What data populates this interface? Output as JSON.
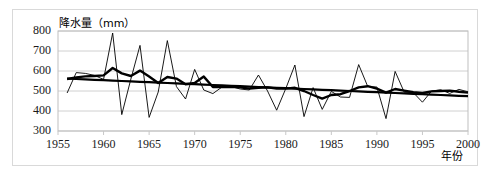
{
  "chart_data": {
    "type": "line",
    "title": "降水量（mm）",
    "xlabel": "年份",
    "ylabel": "",
    "xlim": [
      1955,
      2000
    ],
    "ylim": [
      300,
      800
    ],
    "xticks": [
      "1955",
      "1960",
      "1965",
      "1970",
      "1975",
      "1980",
      "1985",
      "1990",
      "1995",
      "2000"
    ],
    "yticks": [
      "300",
      "400",
      "500",
      "600",
      "700",
      "800"
    ],
    "grid": true,
    "legend": "none",
    "x": [
      1956,
      1957,
      1958,
      1959,
      1960,
      1961,
      1962,
      1963,
      1964,
      1965,
      1966,
      1967,
      1968,
      1969,
      1970,
      1971,
      1972,
      1973,
      1974,
      1975,
      1976,
      1977,
      1978,
      1979,
      1980,
      1981,
      1982,
      1983,
      1984,
      1985,
      1986,
      1987,
      1988,
      1989,
      1990,
      1991,
      1992,
      1993,
      1994,
      1995,
      1996,
      1997,
      1998,
      1999,
      2000
    ],
    "series": [
      {
        "name": "年降水量",
        "style": "thin-line",
        "color": "#000000",
        "values": [
          490,
          592,
          588,
          578,
          558,
          790,
          382,
          560,
          728,
          368,
          495,
          752,
          522,
          460,
          608,
          505,
          487,
          520,
          522,
          510,
          505,
          580,
          500,
          404,
          512,
          630,
          372,
          517,
          408,
          498,
          470,
          468,
          632,
          522,
          520,
          362,
          598,
          494,
          492,
          444,
          500,
          506,
          488,
          508,
          496
        ]
      },
      {
        "name": "滑动平均",
        "style": "thick-line",
        "color": "#000000",
        "values": [
          560,
          568,
          573,
          575,
          578,
          615,
          588,
          575,
          602,
          572,
          540,
          570,
          562,
          534,
          540,
          572,
          520,
          520,
          521,
          518,
          512,
          516,
          518,
          512,
          512,
          516,
          500,
          480,
          462,
          480,
          484,
          500,
          518,
          524,
          512,
          492,
          510,
          502,
          494,
          490,
          498,
          500,
          502,
          496,
          492
        ]
      },
      {
        "name": "线性趋势",
        "style": "trend-line",
        "color": "#000000",
        "values": [
          562,
          560,
          558,
          556,
          554,
          552,
          550,
          548,
          546,
          544,
          542,
          540,
          538,
          536,
          534,
          532,
          530,
          528,
          526,
          524,
          522,
          520,
          518,
          516,
          514,
          512,
          510,
          508,
          506,
          504,
          502,
          500,
          498,
          496,
          494,
          492,
          490,
          488,
          486,
          484,
          482,
          480,
          478,
          476,
          474
        ]
      }
    ]
  },
  "axis": {
    "x_title": "年份",
    "y_unit_title": "降水量（mm）"
  }
}
